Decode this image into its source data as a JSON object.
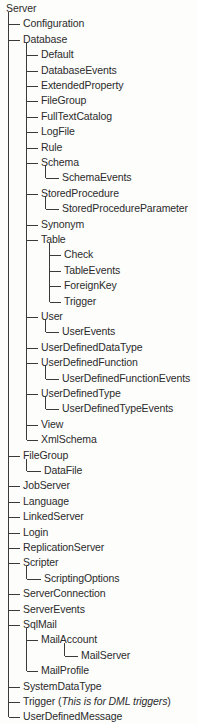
{
  "diagram": {
    "title": "Server",
    "root_label": "Server",
    "colors": {
      "text": "#2b2b2b",
      "line": "#3a3a3a",
      "background": "#fdfdfc"
    },
    "geometry": {
      "row_height": 15.4,
      "first_row_y": 1,
      "level_trunk_x": [
        8,
        26,
        45,
        49
      ],
      "level_label_x": [
        6,
        23,
        41,
        60,
        64
      ]
    },
    "nodes": [
      {
        "label": "Server",
        "level": 0,
        "connector": "none"
      },
      {
        "label": "Configuration",
        "level": 1,
        "connector": "tee"
      },
      {
        "label": "Database",
        "level": 1,
        "connector": "tee"
      },
      {
        "label": "Default",
        "level": 2,
        "connector": "tee"
      },
      {
        "label": "DatabaseEvents",
        "level": 2,
        "connector": "tee"
      },
      {
        "label": "ExtendedProperty",
        "level": 2,
        "connector": "tee"
      },
      {
        "label": "FileGroup",
        "level": 2,
        "connector": "tee"
      },
      {
        "label": "FullTextCatalog",
        "level": 2,
        "connector": "tee"
      },
      {
        "label": "LogFile",
        "level": 2,
        "connector": "tee"
      },
      {
        "label": "Rule",
        "level": 2,
        "connector": "tee"
      },
      {
        "label": "Schema",
        "level": 2,
        "connector": "tee"
      },
      {
        "label": "SchemaEvents",
        "level": 3,
        "connector": "elbow"
      },
      {
        "label": "StoredProcedure",
        "level": 2,
        "connector": "tee"
      },
      {
        "label": "StoredProcedureParameter",
        "level": 3,
        "connector": "elbow"
      },
      {
        "label": "Synonym",
        "level": 2,
        "connector": "tee"
      },
      {
        "label": "Table",
        "level": 2,
        "connector": "tee"
      },
      {
        "label": "Check",
        "level": 3,
        "connector": "tee"
      },
      {
        "label": "TableEvents",
        "level": 3,
        "connector": "tee"
      },
      {
        "label": "ForeignKey",
        "level": 3,
        "connector": "tee"
      },
      {
        "label": "Trigger",
        "level": 3,
        "connector": "elbow-short"
      },
      {
        "label": "User",
        "level": 2,
        "connector": "tee"
      },
      {
        "label": "UserEvents",
        "level": 3,
        "connector": "elbow"
      },
      {
        "label": "UserDefinedDataType",
        "level": 2,
        "connector": "tee"
      },
      {
        "label": "UserDefinedFunction",
        "level": 2,
        "connector": "tee"
      },
      {
        "label": "UserDefinedFunctionEvents",
        "level": 3,
        "connector": "elbow"
      },
      {
        "label": "UserDefinedType",
        "level": 2,
        "connector": "tee"
      },
      {
        "label": "UserDefinedTypeEvents",
        "level": 3,
        "connector": "elbow"
      },
      {
        "label": "View",
        "level": 2,
        "connector": "tee"
      },
      {
        "label": "XmlSchema",
        "level": 2,
        "connector": "elbow-short"
      },
      {
        "label": "FileGroup",
        "level": 1,
        "connector": "tee"
      },
      {
        "label": "DataFile",
        "level": 2,
        "connector": "elbow"
      },
      {
        "label": "JobServer",
        "level": 1,
        "connector": "tee"
      },
      {
        "label": "Language",
        "level": 1,
        "connector": "tee"
      },
      {
        "label": "LinkedServer",
        "level": 1,
        "connector": "tee"
      },
      {
        "label": "Login",
        "level": 1,
        "connector": "tee"
      },
      {
        "label": "ReplicationServer",
        "level": 1,
        "connector": "tee"
      },
      {
        "label": "Scripter",
        "level": 1,
        "connector": "tee"
      },
      {
        "label": "ScriptingOptions",
        "level": 2,
        "connector": "elbow"
      },
      {
        "label": "ServerConnection",
        "level": 1,
        "connector": "tee"
      },
      {
        "label": "ServerEvents",
        "level": 1,
        "connector": "tee"
      },
      {
        "label": "SqlMail",
        "level": 1,
        "connector": "tee"
      },
      {
        "label": "MailAccount",
        "level": 2,
        "connector": "tee"
      },
      {
        "label": "MailServer",
        "level": 3,
        "connector": "elbow"
      },
      {
        "label": "MailProfile",
        "level": 2,
        "connector": "elbow-short"
      },
      {
        "label": "SystemDataType",
        "level": 1,
        "connector": "tee"
      },
      {
        "label": "Trigger",
        "level": 1,
        "connector": "tee",
        "suffix_plain_open": " (",
        "suffix_italic": "This is for DML triggers",
        "suffix_plain_close": ")"
      },
      {
        "label": "UserDefinedMessage",
        "level": 1,
        "connector": "elbow-short"
      }
    ]
  }
}
